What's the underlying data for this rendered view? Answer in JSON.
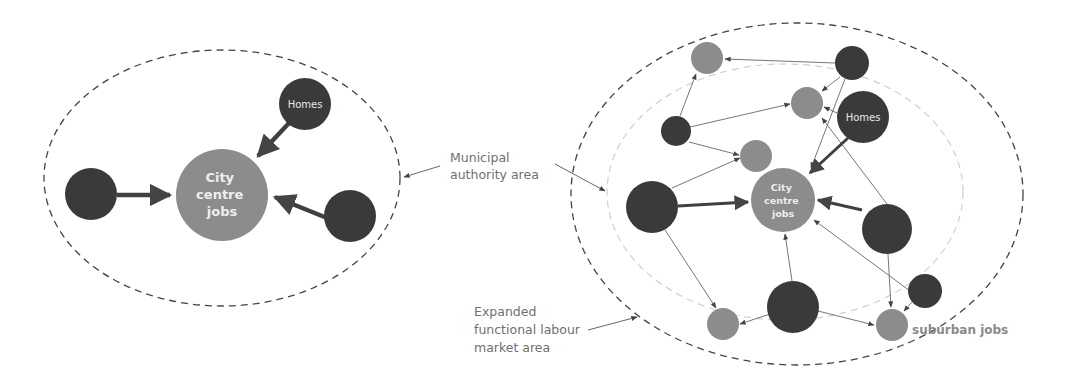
{
  "colors": {
    "home_node": "#3a3a3a",
    "job_node": "#8c8c8c",
    "arrow": "#444444",
    "outer_boundary": "#444444",
    "inner_boundary": "#cfcfcf",
    "label_text": "#6f6f6f"
  },
  "left_diagram": {
    "city_label": [
      "City",
      "centre",
      "jobs"
    ],
    "homes_label": "Homes"
  },
  "right_diagram": {
    "city_label": [
      "City",
      "centre",
      "jobs"
    ],
    "homes_label": "Homes",
    "suburban_label": "suburban jobs"
  },
  "annotations": {
    "municipal": [
      "Municipal",
      "authority area"
    ],
    "expanded": [
      "Expanded",
      "functional labour",
      "market area"
    ]
  }
}
